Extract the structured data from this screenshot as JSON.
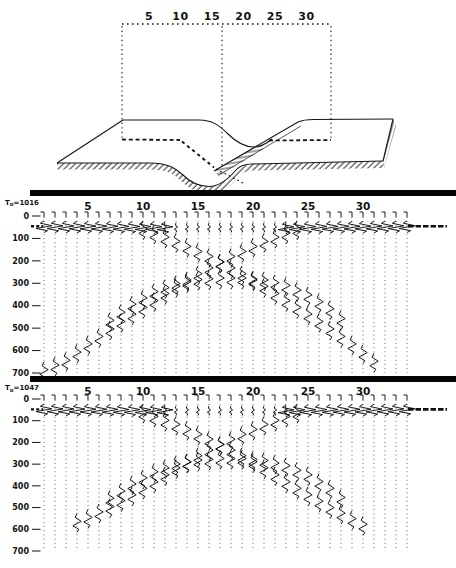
{
  "figure_type": "seismic model and synthetic record sections",
  "model_diagram": {
    "ruler_labels": [
      "5",
      "10",
      "15",
      "20",
      "25",
      "30"
    ],
    "description": "3D block model of a surface with a trough (syncline) between two flat plates, hatched edges, dashed buried interface, dotted ruler with drop lines"
  },
  "chart_data": {
    "type": "seismic-wiggle-sections",
    "shared": {
      "x_axis_labels": [
        5,
        10,
        15,
        20,
        25,
        30
      ],
      "y_axis_labels": [
        0,
        100,
        200,
        300,
        400,
        500,
        600,
        700
      ],
      "n_traces": 34,
      "t_max": 700
    },
    "panels": [
      {
        "label": "To=1016",
        "events": [
          {
            "name": "flat-left",
            "amp": 8,
            "dy": 0.62,
            "extend_left": true,
            "points": [
              [
                1,
                46
              ],
              [
                12,
                51
              ]
            ]
          },
          {
            "name": "flat-center",
            "amp": 1.6,
            "dy": 0.5,
            "points": [
              [
                12,
                51
              ],
              [
                23,
                51
              ]
            ]
          },
          {
            "name": "flat-right",
            "amp": 8,
            "dy": 0.62,
            "extend_right": true,
            "points": [
              [
                23,
                51
              ],
              [
                34,
                46
              ]
            ]
          },
          {
            "name": "limb-dipping-right",
            "amp": 4.2,
            "points": [
              [
                10,
                62
              ],
              [
                13,
                118
              ],
              [
                16,
                185
              ],
              [
                17,
                210
              ],
              [
                19,
                262
              ],
              [
                21,
                318
              ],
              [
                23,
                382
              ],
              [
                25,
                442
              ],
              [
                27,
                508
              ],
              [
                29,
                575
              ],
              [
                31,
                652
              ]
            ]
          },
          {
            "name": "limb-dipping-left",
            "amp": 4.2,
            "points": [
              [
                1,
                690
              ],
              [
                3,
                648
              ],
              [
                5,
                575
              ],
              [
                7,
                508
              ],
              [
                9,
                442
              ],
              [
                11,
                382
              ],
              [
                13,
                318
              ],
              [
                15,
                262
              ],
              [
                17,
                210
              ],
              [
                18,
                185
              ],
              [
                21,
                118
              ],
              [
                24,
                62
              ]
            ]
          },
          {
            "name": "trough-bottom-arch",
            "amp": 4.2,
            "points": [
              [
                7,
                470
              ],
              [
                9,
                398
              ],
              [
                11,
                342
              ],
              [
                13,
                306
              ],
              [
                15,
                288
              ],
              [
                17,
                281
              ],
              [
                19,
                281
              ],
              [
                21,
                290
              ],
              [
                23,
                314
              ],
              [
                25,
                356
              ],
              [
                27,
                418
              ],
              [
                28,
                462
              ]
            ]
          }
        ]
      },
      {
        "label": "To=1047",
        "events": [
          {
            "name": "flat-left",
            "amp": 8,
            "dy": 0.62,
            "extend_left": true,
            "points": [
              [
                1,
                48
              ],
              [
                12,
                53
              ]
            ]
          },
          {
            "name": "flat-center",
            "amp": 1.6,
            "dy": 0.5,
            "points": [
              [
                12,
                53
              ],
              [
                23,
                53
              ]
            ]
          },
          {
            "name": "flat-right",
            "amp": 8,
            "dy": 0.62,
            "extend_right": true,
            "points": [
              [
                23,
                53
              ],
              [
                34,
                48
              ]
            ]
          },
          {
            "name": "limb-dipping-right",
            "amp": 4.2,
            "points": [
              [
                10,
                66
              ],
              [
                13,
                122
              ],
              [
                16,
                190
              ],
              [
                17,
                214
              ],
              [
                19,
                266
              ],
              [
                21,
                322
              ],
              [
                23,
                386
              ],
              [
                25,
                446
              ],
              [
                27,
                505
              ],
              [
                29,
                556
              ],
              [
                30,
                582
              ]
            ]
          },
          {
            "name": "limb-dipping-left",
            "amp": 4.2,
            "points": [
              [
                4,
                568
              ],
              [
                5,
                550
              ],
              [
                7,
                500
              ],
              [
                9,
                446
              ],
              [
                11,
                386
              ],
              [
                13,
                322
              ],
              [
                15,
                266
              ],
              [
                17,
                214
              ],
              [
                18,
                190
              ],
              [
                21,
                122
              ],
              [
                24,
                66
              ]
            ]
          },
          {
            "name": "trough-bottom-arch",
            "amp": 4.2,
            "points": [
              [
                7,
                462
              ],
              [
                9,
                396
              ],
              [
                11,
                340
              ],
              [
                13,
                304
              ],
              [
                15,
                286
              ],
              [
                17,
                279
              ],
              [
                19,
                279
              ],
              [
                21,
                288
              ],
              [
                23,
                312
              ],
              [
                25,
                354
              ],
              [
                27,
                416
              ],
              [
                28,
                458
              ]
            ]
          }
        ]
      }
    ]
  }
}
